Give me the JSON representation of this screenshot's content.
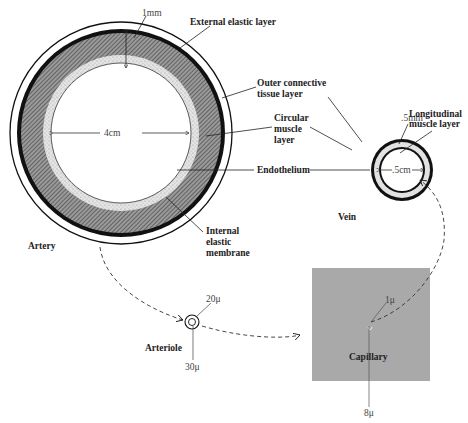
{
  "diagram": {
    "type": "anatomical-comparison",
    "colors": {
      "ink": "#111111",
      "hatch": "#7a7a7a",
      "speckle": "#d6d6d6",
      "capillary_bg": "#a9a9a9"
    }
  },
  "artery": {
    "name": "Artery",
    "wall_thickness": "1mm",
    "lumen_diameter": "4cm",
    "labels": {
      "external_elastic": "External elastic layer",
      "outer_connective_1": "Outer connective",
      "outer_connective_2": "tissue layer",
      "circular_1": "Circular",
      "circular_2": "muscle",
      "circular_3": "layer",
      "endothelium": "Endothelium",
      "internal_1": "Internal",
      "internal_2": "elastic",
      "internal_3": "membrane"
    }
  },
  "vein": {
    "name": "Vein",
    "wall_thickness": ".5mm",
    "lumen_diameter": ".5cm",
    "labels": {
      "longitudinal_1": "Longitudinal",
      "longitudinal_2": "muscle layer"
    }
  },
  "arteriole": {
    "name": "Arteriole",
    "inner": "20μ",
    "outer": "30μ"
  },
  "capillary": {
    "name": "Capillary",
    "wall": "1μ",
    "diameter": "8μ"
  }
}
